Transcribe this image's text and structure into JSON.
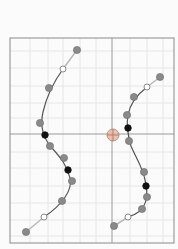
{
  "canvas": {
    "width": 178,
    "height": 249,
    "background": "#fbfbfb"
  },
  "frame": {
    "x": 10,
    "y": 38,
    "width": 164,
    "height": 205,
    "stroke": "#8a8a8a"
  },
  "axes": {
    "vertical_x": 112,
    "horizontal_y": 134,
    "stroke": "#9a9a9a"
  },
  "grid": {
    "stroke": "#e6e6e6",
    "x": [
      30,
      48,
      63,
      80,
      96,
      130,
      147,
      163
    ],
    "y": [
      51,
      68,
      86,
      103,
      118,
      152,
      168,
      186,
      203,
      220,
      236
    ]
  },
  "center_marker": {
    "cx": 113,
    "cy": 135,
    "r": 6,
    "fill": "#e8b9a8",
    "stroke": "#b07f6f"
  },
  "colors": {
    "curve": "#555555",
    "handle_line": "#b8b8b8",
    "point_fill": "#8a8a8a",
    "point_stroke": "#6a6a6a",
    "key_point": "#111111",
    "hollow_fill": "#ffffff",
    "hollow_stroke": "#8a8a8a"
  },
  "curves": [
    {
      "name": "left-curve",
      "path": "M63 69 C55 80 47 95 43 112 C40 125 43 138 52 148 C60 157 67 165 70 178 C73 190 62 205 44 217",
      "handles": [
        {
          "x1": 77,
          "y1": 50,
          "x2": 63,
          "y2": 69
        },
        {
          "x1": 44,
          "y1": 217,
          "x2": 26,
          "y2": 232
        }
      ],
      "points": [
        {
          "x": 77,
          "y": 50,
          "type": "filled"
        },
        {
          "x": 63,
          "y": 69,
          "type": "hollow"
        },
        {
          "x": 49,
          "y": 88,
          "type": "filled"
        },
        {
          "x": 40,
          "y": 123,
          "type": "filled"
        },
        {
          "x": 45,
          "y": 135,
          "type": "key"
        },
        {
          "x": 50,
          "y": 146,
          "type": "filled"
        },
        {
          "x": 64,
          "y": 158,
          "type": "filled"
        },
        {
          "x": 68,
          "y": 170,
          "type": "key"
        },
        {
          "x": 72,
          "y": 181,
          "type": "filled"
        },
        {
          "x": 62,
          "y": 201,
          "type": "filled"
        },
        {
          "x": 44,
          "y": 217,
          "type": "hollow"
        },
        {
          "x": 26,
          "y": 232,
          "type": "filled"
        }
      ]
    },
    {
      "name": "right-curve",
      "path": "M147 87 C138 94 130 103 128 115 C126 126 128 136 131 146 C136 158 143 168 145 180 C148 192 147 204 140 211 C136 214 132 216 128 217",
      "handles": [
        {
          "x1": 160,
          "y1": 77,
          "x2": 147,
          "y2": 87
        },
        {
          "x1": 128,
          "y1": 217,
          "x2": 114,
          "y2": 226
        }
      ],
      "points": [
        {
          "x": 160,
          "y": 77,
          "type": "filled"
        },
        {
          "x": 147,
          "y": 87,
          "type": "hollow"
        },
        {
          "x": 134,
          "y": 97,
          "type": "filled"
        },
        {
          "x": 127,
          "y": 115,
          "type": "filled"
        },
        {
          "x": 128,
          "y": 128,
          "type": "key"
        },
        {
          "x": 129,
          "y": 141,
          "type": "filled"
        },
        {
          "x": 144,
          "y": 172,
          "type": "filled"
        },
        {
          "x": 146,
          "y": 186,
          "type": "key"
        },
        {
          "x": 147,
          "y": 197,
          "type": "filled"
        },
        {
          "x": 142,
          "y": 209,
          "type": "filled"
        },
        {
          "x": 128,
          "y": 217,
          "type": "hollow"
        },
        {
          "x": 114,
          "y": 226,
          "type": "filled"
        }
      ]
    }
  ]
}
